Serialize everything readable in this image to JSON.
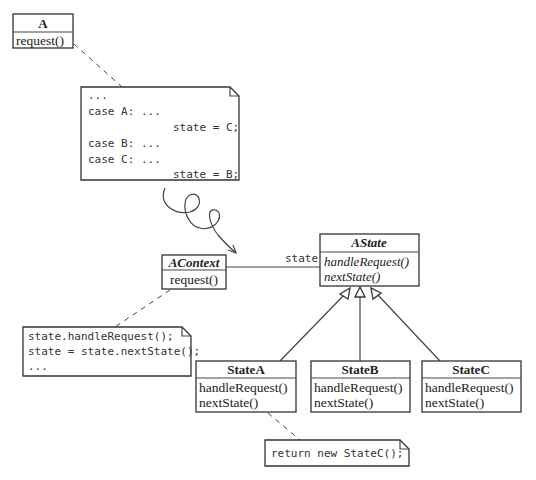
{
  "classes": {
    "A": {
      "name": "A",
      "methods": [
        "request()"
      ]
    },
    "AContext": {
      "name": "AContext",
      "methods": [
        "request()"
      ]
    },
    "AState": {
      "name": "AState",
      "methods": [
        "handleRequest()",
        "nextState()"
      ]
    },
    "StateA": {
      "name": "StateA",
      "methods": [
        "handleRequest()",
        "nextState()"
      ]
    },
    "StateB": {
      "name": "StateB",
      "methods": [
        "handleRequest()",
        "nextState()"
      ]
    },
    "StateC": {
      "name": "StateC",
      "methods": [
        "handleRequest()",
        "nextState()"
      ]
    }
  },
  "association": {
    "label": "state"
  },
  "notes": {
    "switch": [
      "...",
      "case A: ...",
      "state = C;",
      "case B: ...",
      "case C: ...",
      "state = B;"
    ],
    "context": [
      "state.handleRequest();",
      "state = state.nextState();",
      "..."
    ],
    "stateA": [
      "return new StateC();"
    ]
  }
}
